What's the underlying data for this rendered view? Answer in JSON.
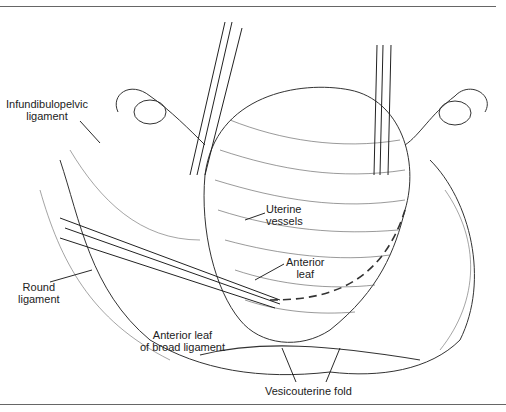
{
  "figure": {
    "type": "surgical illustration",
    "labels": {
      "infundibulopelvic": [
        "Infundibulopelvic",
        "ligament"
      ],
      "uterine_vessels": [
        "Uterine",
        "vessels"
      ],
      "anterior_leaf": [
        "Anterior",
        "leaf"
      ],
      "round_ligament": [
        "Round",
        "ligament"
      ],
      "anterior_leaf_broad": [
        "Anterior leaf",
        "of broad ligament"
      ],
      "vesicouterine_fold": "Vesicouterine fold"
    },
    "colors": {
      "ink": "#222222",
      "background": "#ffffff",
      "rule": "#666666"
    }
  }
}
